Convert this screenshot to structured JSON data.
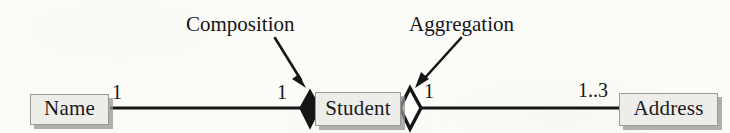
{
  "diagram": {
    "background_color": "#fbfbf8",
    "ink_color": "#161616",
    "box_fill_color": "#ededea",
    "box_border_color": "#9a9a97",
    "box_shadow_color": "#969694",
    "classes": [
      {
        "id": "name",
        "label": "Name"
      },
      {
        "id": "student",
        "label": "Student"
      },
      {
        "id": "address",
        "label": "Address"
      }
    ],
    "annotations": [
      {
        "id": "composition",
        "label": "Composition",
        "points_to": "filled-diamond"
      },
      {
        "id": "aggregation",
        "label": "Aggregation",
        "points_to": "hollow-diamond"
      }
    ],
    "associations": [
      {
        "id": "name-student",
        "from": "Name",
        "to": "Student",
        "from_multiplicity": "1",
        "to_multiplicity": "1",
        "adornment": "filled-diamond",
        "adornment_end": "Student",
        "kind": "composition"
      },
      {
        "id": "student-address",
        "from": "Student",
        "to": "Address",
        "from_multiplicity": "1",
        "to_multiplicity": "1..3",
        "adornment": "hollow-diamond",
        "adornment_end": "Student",
        "kind": "aggregation"
      }
    ],
    "multiplicities": {
      "name_side": "1",
      "student_left": "1",
      "student_right": "1",
      "address_side": "1..3"
    }
  }
}
